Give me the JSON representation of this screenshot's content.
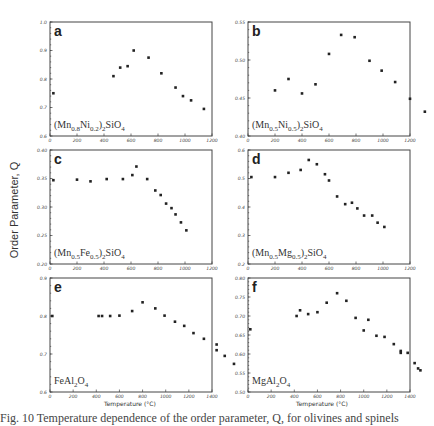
{
  "figure": {
    "ylabel": "Order Parameter, Q",
    "xlabel": "Temperature (°C)",
    "caption": "Fig. 10 Temperature dependence of the order parameter, Q, for olivines and spinels"
  },
  "chart_data": [
    {
      "type": "scatter",
      "panel": "a",
      "label": "(Mn0.8Ni0.2)2SiO4",
      "xlabel": "",
      "ylabel": "Order Parameter, Q",
      "xlim": [
        0,
        1200
      ],
      "ylim": [
        0.6,
        1.0
      ],
      "xticks": [
        0,
        200,
        400,
        600,
        800,
        1000,
        1200
      ],
      "yticks": [
        0.6,
        0.7,
        0.8,
        0.9,
        1.0
      ],
      "x": [
        25,
        470,
        520,
        575,
        620,
        730,
        825,
        930,
        985,
        1045,
        1140
      ],
      "y": [
        0.75,
        0.81,
        0.84,
        0.845,
        0.9,
        0.875,
        0.82,
        0.77,
        0.74,
        0.725,
        0.695
      ]
    },
    {
      "type": "scatter",
      "panel": "b",
      "label": "(Mn0.5Ni0.5)2SiO4",
      "xlabel": "",
      "ylabel": "",
      "xlim": [
        0,
        1200
      ],
      "ylim": [
        0.4,
        0.55
      ],
      "xticks": [
        0,
        200,
        400,
        600,
        800,
        1000,
        1200
      ],
      "yticks": [
        0.4,
        0.45,
        0.5,
        0.55
      ],
      "x": [
        200,
        300,
        400,
        500,
        600,
        690,
        790,
        900,
        990,
        1090,
        1200,
        1310,
        1390
      ],
      "y": [
        0.46,
        0.475,
        0.456,
        0.468,
        0.508,
        0.533,
        0.53,
        0.499,
        0.486,
        0.471,
        0.449,
        0.432,
        0.42
      ]
    },
    {
      "type": "scatter",
      "panel": "c",
      "label": "(Mn0.5Fe0.5)2SiO4",
      "xlabel": "",
      "ylabel": "Order Parameter, Q",
      "xlim": [
        0,
        1200
      ],
      "ylim": [
        0.2,
        0.4
      ],
      "xticks": [
        0,
        200,
        400,
        600,
        800,
        1000,
        1200
      ],
      "yticks": [
        0.2,
        0.25,
        0.3,
        0.35,
        0.4
      ],
      "x": [
        25,
        200,
        300,
        420,
        540,
        610,
        640,
        720,
        780,
        820,
        860,
        900,
        930,
        970,
        1010
      ],
      "y": [
        0.347,
        0.348,
        0.345,
        0.349,
        0.349,
        0.356,
        0.371,
        0.349,
        0.329,
        0.321,
        0.306,
        0.298,
        0.287,
        0.273,
        0.259
      ]
    },
    {
      "type": "scatter",
      "panel": "d",
      "label": "(Mn0.5Mg0.5)2SiO4",
      "xlabel": "",
      "ylabel": "",
      "xlim": [
        0,
        1200
      ],
      "ylim": [
        0.2,
        0.6
      ],
      "xticks": [
        0,
        200,
        400,
        600,
        800,
        1000,
        1200
      ],
      "yticks": [
        0.2,
        0.3,
        0.4,
        0.5,
        0.6
      ],
      "x": [
        25,
        200,
        300,
        390,
        450,
        510,
        570,
        600,
        660,
        720,
        770,
        810,
        860,
        920,
        960,
        1010
      ],
      "y": [
        0.505,
        0.505,
        0.52,
        0.53,
        0.565,
        0.55,
        0.515,
        0.493,
        0.437,
        0.41,
        0.415,
        0.395,
        0.37,
        0.37,
        0.345,
        0.33
      ]
    },
    {
      "type": "scatter",
      "panel": "e",
      "label": "FeAl2O4",
      "xlabel": "Temperature (°C)",
      "ylabel": "Order Parameter, Q",
      "xlim": [
        0,
        1400
      ],
      "ylim": [
        0.6,
        0.9
      ],
      "xticks": [
        0,
        200,
        400,
        600,
        800,
        1000,
        1200,
        1400
      ],
      "yticks": [
        0.6,
        0.7,
        0.8,
        0.9
      ],
      "x": [
        20,
        420,
        450,
        520,
        600,
        710,
        800,
        910,
        990,
        1080,
        1160,
        1240,
        1330,
        1440,
        1440,
        1510,
        1590
      ],
      "y": [
        0.8,
        0.8,
        0.8,
        0.8,
        0.801,
        0.813,
        0.836,
        0.82,
        0.801,
        0.785,
        0.774,
        0.755,
        0.74,
        0.725,
        0.71,
        0.695,
        0.674
      ]
    },
    {
      "type": "scatter",
      "panel": "f",
      "label": "MgAl2O4",
      "xlabel": "Temperature (°C)",
      "ylabel": "",
      "xlim": [
        0,
        1400
      ],
      "ylim": [
        0.5,
        0.8
      ],
      "xticks": [
        0,
        200,
        400,
        600,
        800,
        1000,
        1200,
        1400
      ],
      "yticks": [
        0.5,
        0.55,
        0.6,
        0.65,
        0.7,
        0.75,
        0.8
      ],
      "x": [
        20,
        420,
        450,
        520,
        600,
        680,
        770,
        850,
        930,
        1000,
        1040,
        1110,
        1180,
        1260,
        1320,
        1320,
        1380,
        1440,
        1470,
        1490
      ],
      "y": [
        0.665,
        0.7,
        0.715,
        0.705,
        0.71,
        0.735,
        0.76,
        0.74,
        0.695,
        0.662,
        0.69,
        0.648,
        0.645,
        0.626,
        0.608,
        0.603,
        0.603,
        0.576,
        0.562,
        0.557
      ]
    }
  ]
}
